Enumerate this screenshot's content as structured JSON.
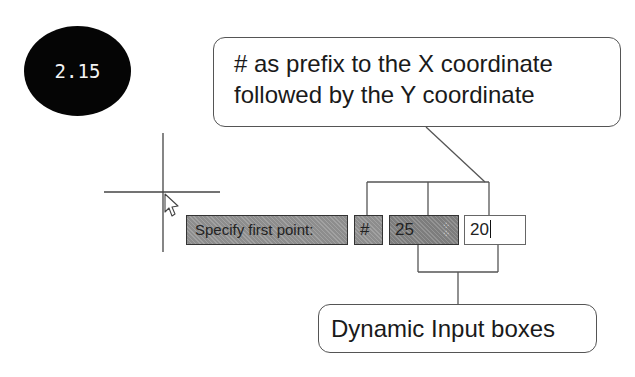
{
  "figure": {
    "number": "2.15"
  },
  "callouts": {
    "top_line1": "# as prefix to the X coordinate",
    "top_line2": "followed by the Y coordinate",
    "bottom": "Dynamic Input boxes"
  },
  "dynamic_input": {
    "prompt": "Specify first point:",
    "prefix": "#",
    "x_value": "25",
    "y_value": "20",
    "tab_icon": "tab-lock-icon"
  },
  "cursor": {
    "type": "crosshair-with-arrow"
  },
  "colors": {
    "badge_bg": "#050505",
    "input_gray": "#8d8d8d",
    "line": "#555555"
  }
}
